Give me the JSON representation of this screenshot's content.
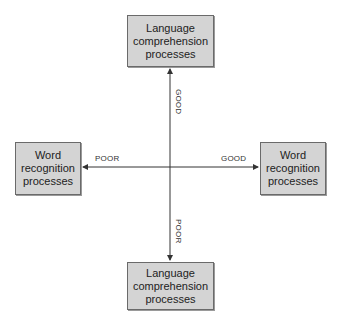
{
  "diagram": {
    "boxes": {
      "top": {
        "label": "Language\ncomprehension\nprocesses"
      },
      "left": {
        "label": "Word\nrecognition\nprocesses"
      },
      "right": {
        "label": "Word\nrecognition\nprocesses"
      },
      "bottom": {
        "label": "Language\ncomprehension\nprocesses"
      }
    },
    "axis_labels": {
      "up": "GOOD",
      "down": "POOR",
      "left": "POOR",
      "right": "GOOD"
    },
    "colors": {
      "box_fill": "#d4d4d4",
      "box_border": "#6a6a6a",
      "line": "#333333"
    }
  }
}
